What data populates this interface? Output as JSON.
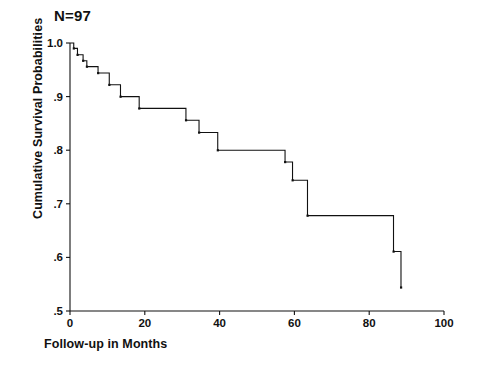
{
  "annotations": {
    "sample_size_label": "N=97"
  },
  "chart_data": {
    "type": "line",
    "title": "",
    "subtitle": "",
    "xlabel": "Follow-up in Months",
    "ylabel": "Cumulative Survival Probabilities",
    "xlim": [
      0,
      100
    ],
    "ylim": [
      0.5,
      1.0
    ],
    "xticks": [
      0,
      20,
      40,
      60,
      80,
      100
    ],
    "xtick_labels": [
      "0",
      "20",
      "40",
      "60",
      "80",
      "100"
    ],
    "yticks": [
      0.5,
      0.6,
      0.7,
      0.8,
      0.9,
      1.0
    ],
    "ytick_labels": [
      ".5",
      ".6",
      ".7",
      ".8",
      ".9",
      "1.0"
    ],
    "grid": false,
    "legend": false,
    "series": [
      {
        "name": "Cumulative survival",
        "step": "post",
        "x": [
          0,
          1.0,
          1.0,
          2.0,
          2.0,
          3.5,
          3.5,
          4.5,
          4.5,
          7.5,
          7.5,
          10.5,
          10.5,
          13.5,
          13.5,
          18.5,
          18.5,
          31.0,
          31.0,
          34.5,
          34.5,
          39.5,
          39.5,
          57.5,
          57.5,
          59.5,
          59.5,
          63.5,
          63.5,
          86.5,
          86.5,
          88.5,
          88.5
        ],
        "y": [
          1.0,
          1.0,
          0.99,
          0.99,
          0.978,
          0.978,
          0.967,
          0.967,
          0.956,
          0.956,
          0.944,
          0.944,
          0.922,
          0.922,
          0.9,
          0.9,
          0.878,
          0.878,
          0.856,
          0.856,
          0.833,
          0.833,
          0.8,
          0.8,
          0.778,
          0.778,
          0.744,
          0.744,
          0.678,
          0.678,
          0.611,
          0.611,
          0.544
        ]
      }
    ]
  }
}
